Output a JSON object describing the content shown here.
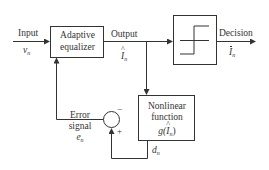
{
  "diagram": {
    "type": "block-diagram",
    "blocks": {
      "equalizer": {
        "line1": "Adaptive",
        "line2": "equalizer"
      },
      "decision": {
        "glyph": "hard-limiter-step"
      },
      "nonlinear": {
        "line1": "Nonlinear",
        "line2": "function",
        "expr_prefix": "g(",
        "expr_var": "I",
        "expr_sub": "n",
        "expr_suffix": ")"
      },
      "summer": {
        "minus": "−",
        "plus": "+"
      }
    },
    "signals": {
      "input": {
        "label": "Input",
        "var": "v",
        "sub": "n"
      },
      "output": {
        "label": "Output",
        "var": "I",
        "sub": "n"
      },
      "decision": {
        "label": "Decision",
        "var": "I",
        "sub": "n"
      },
      "error": {
        "line1": "Error",
        "line2": "signal",
        "var": "e",
        "sub": "n"
      },
      "desired": {
        "var": "d",
        "sub": "n"
      }
    },
    "colors": {
      "stroke": "#333333",
      "background": "#ffffff"
    }
  }
}
